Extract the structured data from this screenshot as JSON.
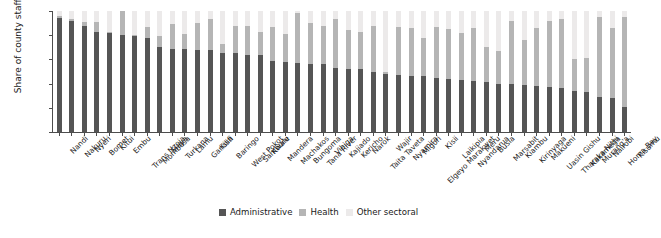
{
  "chart_data": {
    "type": "bar",
    "subtype": "stacked-vertical-100",
    "title": "",
    "xlabel": "",
    "ylabel": "Share of county staff (%)",
    "ylim": [
      0,
      100
    ],
    "yticks": [
      0,
      20,
      40,
      60,
      80,
      100
    ],
    "grid": false,
    "legend_position": "bottom-center",
    "categories": [
      "Nandi",
      "Nakuru",
      "Nyeri",
      "Bomet",
      "Kitui",
      "Embu",
      "Trans Nzoia",
      "Mombasa",
      "Siaya",
      "Turkana",
      "Lamu",
      "Garissa",
      "Kilifi",
      "Baringo",
      "West Pokot",
      "Samburu",
      "Kwale",
      "Mandera",
      "Machakos",
      "Bungoma",
      "Tana River",
      "Vihiga",
      "Kajiado",
      "Kericho",
      "Narok",
      "Taita Taveta",
      "Wajir",
      "Nyamira",
      "Migori",
      "Elgeyo Marakwet",
      "Kisii",
      "Laikipia",
      "Nyandarua",
      "Meru",
      "Busia",
      "Marsabit",
      "Kiambu",
      "Kirinyaga",
      "Makueni",
      "Uasin Gishu",
      "Tharaka Nithi",
      "Kakamega",
      "Murang'a",
      "Nairobi",
      "Homa Bay",
      "Kisumu"
    ],
    "series": [
      {
        "name": "Administrative",
        "color": "#555555",
        "values": [
          94,
          92,
          88,
          83,
          82,
          80,
          79,
          78,
          70,
          69,
          69,
          68,
          68,
          65,
          65,
          64,
          64,
          59,
          58,
          57,
          56,
          56,
          53,
          52,
          52,
          50,
          48,
          47,
          46,
          46,
          45,
          44,
          43,
          42,
          41,
          40,
          40,
          39,
          38,
          37,
          36,
          34,
          33,
          29,
          28,
          21
        ]
      },
      {
        "name": "Health",
        "color": "#b5b5b5",
        "values": [
          2,
          1,
          3,
          8,
          1,
          20,
          1,
          9,
          9,
          20,
          12,
          22,
          25,
          8,
          23,
          24,
          19,
          28,
          23,
          41,
          34,
          32,
          40,
          32,
          31,
          38,
          2,
          40,
          40,
          32,
          42,
          41,
          39,
          44,
          29,
          27,
          52,
          37,
          48,
          55,
          57,
          26,
          28,
          66,
          58,
          74
        ]
      },
      {
        "name": "Other sectoral",
        "color": "#eceaea",
        "values": [
          4,
          7,
          9,
          9,
          17,
          0,
          20,
          13,
          21,
          11,
          19,
          10,
          7,
          27,
          12,
          12,
          17,
          13,
          19,
          2,
          10,
          12,
          7,
          16,
          17,
          12,
          50,
          13,
          14,
          22,
          13,
          15,
          18,
          14,
          30,
          33,
          8,
          24,
          14,
          8,
          7,
          40,
          39,
          5,
          14,
          5
        ]
      }
    ]
  },
  "legend": {
    "items": [
      {
        "label": "Administrative"
      },
      {
        "label": "Health"
      },
      {
        "label": "Other sectoral"
      }
    ]
  }
}
